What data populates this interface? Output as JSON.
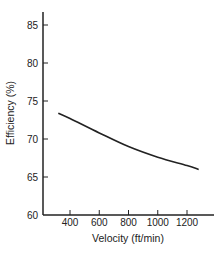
{
  "chart_data": {
    "type": "line",
    "title": "",
    "xlabel": "Velocity (ft/min)",
    "ylabel": "Efficiency (%)",
    "xlim": [
      200,
      1400
    ],
    "ylim": [
      60,
      87
    ],
    "x_ticks": [
      400,
      600,
      800,
      1000,
      1200
    ],
    "y_ticks": [
      60,
      65,
      70,
      75,
      80,
      85
    ],
    "grid": false,
    "legend": null,
    "series": [
      {
        "name": "Efficiency",
        "x": [
          320,
          400,
          600,
          800,
          1000,
          1200,
          1280
        ],
        "y": [
          73.4,
          72.7,
          70.8,
          69.0,
          67.6,
          66.5,
          66.0
        ]
      }
    ]
  },
  "colors": {
    "line": "#222222",
    "axis": "#222222",
    "background": "#ffffff"
  }
}
